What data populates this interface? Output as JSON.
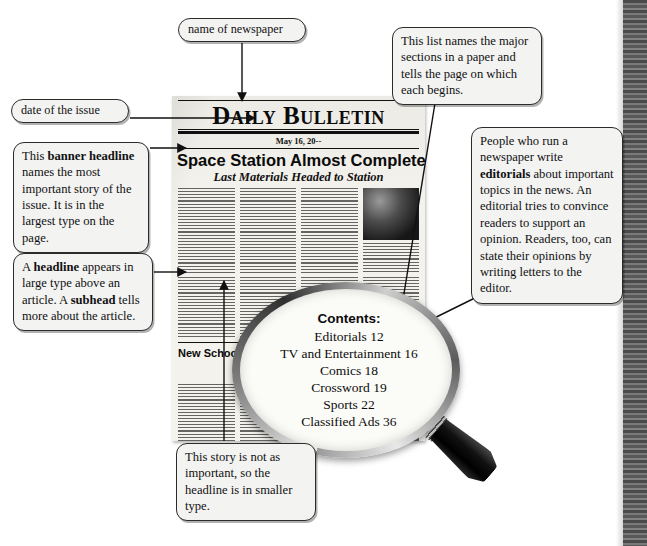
{
  "newspaper": {
    "name": "Daily Bulletin",
    "date": "May 16, 20--",
    "banner_headline": "Space Station Almost Completed",
    "subhead": "Last Materials Headed to Station",
    "second_headline": "New School Okayed for Elm Street",
    "third_headline": "U.S. Wins Gold at Olympics"
  },
  "magnifier": {
    "contents_title": "Contents:",
    "contents": [
      "Editorials 12",
      "TV and Entertainment 16",
      "Comics 18",
      "Crossword 19",
      "Sports 22",
      "Classified Ads 36"
    ]
  },
  "callouts": {
    "newspaper_name": "name of newspaper",
    "date": "date of the issue",
    "banner": {
      "part1": "This ",
      "bold1": "banner headline",
      "part2": " names the most important story of the issue. It is in the largest type on the page."
    },
    "headline": {
      "part1": "A ",
      "bold1": "headline",
      "part2": " appears in large type above an article. A ",
      "bold2": "subhead",
      "part3": " tells more about the article."
    },
    "sections": "This list names the major sections in a paper and tells the page on which each begins.",
    "editorial": {
      "part1": "People who run a newspaper write ",
      "bold1": "editorials",
      "part2": " about important topics in the news. An editorial tries to convince readers to support an opinion. Readers, too, can state their opinions by writing letters to the editor."
    },
    "smaller_type": "This story is not as important, so the headline is in smaller type."
  },
  "colors": {
    "page_background": "#ffffff",
    "newsprint": "#f4f2ec",
    "ink": "#0a0a0a",
    "callout_fill": "#f3f3f1",
    "callout_border": "#2b2b2b",
    "scan_stripe": "#3a3a3a"
  }
}
